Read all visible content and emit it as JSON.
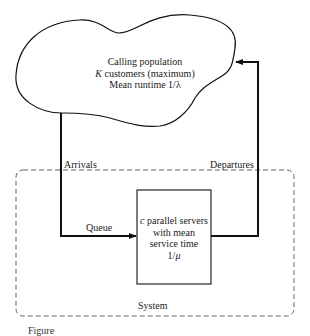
{
  "diagram": {
    "type": "finite-source queueing system",
    "calling_population": {
      "title": "Calling population",
      "capacity_var": "K",
      "capacity_text": " customers (maximum)",
      "runtime_text": "Mean runtime 1/λ"
    },
    "flows": {
      "arrivals": "Arrivals",
      "departures": "Departures",
      "queue": "Queue"
    },
    "server": {
      "count_var": "c",
      "line1_text": " parallel servers",
      "line2": "with mean",
      "line3": "service time",
      "line4_prefix": "1/",
      "line4_var": "μ"
    },
    "system_label": "System",
    "caption_partial": "Figure"
  },
  "colors": {
    "line": "#111111",
    "dashed": "#555555",
    "background": "#ffffff"
  }
}
